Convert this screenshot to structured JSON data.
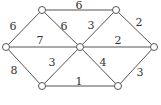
{
  "diagram": {
    "type": "weighted-graph",
    "nodes": [
      {
        "id": "A",
        "x": 6,
        "y": 47
      },
      {
        "id": "B",
        "x": 42,
        "y": 10
      },
      {
        "id": "C",
        "x": 42,
        "y": 86
      },
      {
        "id": "D",
        "x": 80,
        "y": 47
      },
      {
        "id": "E",
        "x": 116,
        "y": 10
      },
      {
        "id": "F",
        "x": 118,
        "y": 86
      },
      {
        "id": "G",
        "x": 154,
        "y": 47
      }
    ],
    "edges": [
      {
        "from": "A",
        "to": "B",
        "weight": "6",
        "lx": 13,
        "ly": 30
      },
      {
        "from": "A",
        "to": "D",
        "weight": "7",
        "lx": 40,
        "ly": 44
      },
      {
        "from": "A",
        "to": "C",
        "weight": "8",
        "lx": 14,
        "ly": 74
      },
      {
        "from": "B",
        "to": "E",
        "weight": "6",
        "lx": 79,
        "ly": 9
      },
      {
        "from": "B",
        "to": "D",
        "weight": "6",
        "lx": 64,
        "ly": 30
      },
      {
        "from": "C",
        "to": "D",
        "weight": "3",
        "lx": 52,
        "ly": 66
      },
      {
        "from": "C",
        "to": "F",
        "weight": "1",
        "lx": 79,
        "ly": 85
      },
      {
        "from": "E",
        "to": "D",
        "weight": "3",
        "lx": 91,
        "ly": 29
      },
      {
        "from": "E",
        "to": "G",
        "weight": "2",
        "lx": 139,
        "ly": 26
      },
      {
        "from": "D",
        "to": "G",
        "weight": "2",
        "lx": 118,
        "ly": 44
      },
      {
        "from": "D",
        "to": "F",
        "weight": "4",
        "lx": 103,
        "ly": 66
      },
      {
        "from": "F",
        "to": "G",
        "weight": "3",
        "lx": 140,
        "ly": 76
      }
    ]
  }
}
